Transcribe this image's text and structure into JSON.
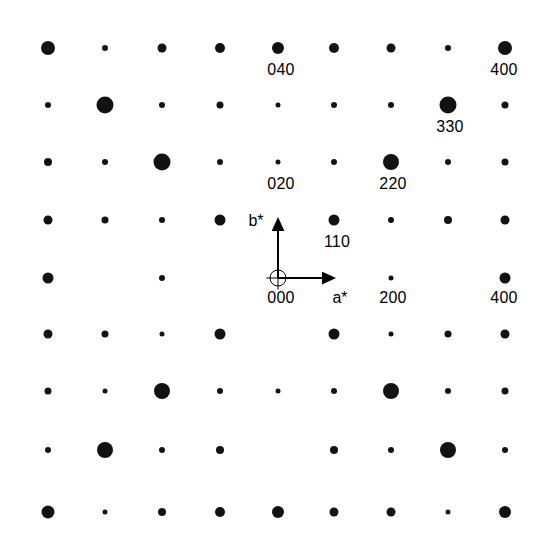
{
  "figure": {
    "kind": "electron-diffraction-pattern",
    "width": 544,
    "height": 550,
    "background_color": "#ffffff",
    "spot_color": "#121212",
    "text_color": "#000000"
  },
  "chart_data": {
    "type": "scatter",
    "title": "",
    "subtitle": "",
    "xlabel": "a*",
    "ylabel": "b*",
    "grid": false,
    "legend": null,
    "axis_ranges": {
      "x": [
        -4,
        4
      ],
      "y": [
        -4,
        4
      ]
    },
    "origin_px": {
      "x": 278,
      "y": 278
    },
    "lattice_spacing_px": 57.0,
    "marker_scale": {
      "description": "marker diameter in px by intensity class",
      "tiny": 5,
      "small": 7,
      "medium": 10,
      "large": 14,
      "xlarge": 17
    },
    "columns_px": [
      48,
      105,
      162,
      220,
      278,
      334,
      391,
      448,
      505
    ],
    "rows_px": [
      48,
      105,
      162,
      220,
      278,
      334,
      391,
      448,
      510
    ],
    "points": [
      {
        "h": -4,
        "k": 4,
        "x": 48,
        "y": 48,
        "d": 14
      },
      {
        "h": -3,
        "k": 4,
        "x": 105,
        "y": 48,
        "d": 6
      },
      {
        "h": -2,
        "k": 4,
        "x": 162,
        "y": 48,
        "d": 9
      },
      {
        "h": -1,
        "k": 4,
        "x": 220,
        "y": 48,
        "d": 10
      },
      {
        "h": 0,
        "k": 4,
        "x": 278,
        "y": 48,
        "d": 12
      },
      {
        "h": 1,
        "k": 4,
        "x": 334,
        "y": 48,
        "d": 10
      },
      {
        "h": 2,
        "k": 4,
        "x": 391,
        "y": 48,
        "d": 9
      },
      {
        "h": 3,
        "k": 4,
        "x": 448,
        "y": 48,
        "d": 6
      },
      {
        "h": 4,
        "k": 4,
        "x": 505,
        "y": 48,
        "d": 14
      },
      {
        "h": -4,
        "k": 3,
        "x": 48,
        "y": 105,
        "d": 6
      },
      {
        "h": -3,
        "k": 3,
        "x": 105,
        "y": 105,
        "d": 17
      },
      {
        "h": -2,
        "k": 3,
        "x": 162,
        "y": 105,
        "d": 6
      },
      {
        "h": -1,
        "k": 3,
        "x": 220,
        "y": 105,
        "d": 7
      },
      {
        "h": 0,
        "k": 3,
        "x": 278,
        "y": 105,
        "d": 5
      },
      {
        "h": 1,
        "k": 3,
        "x": 334,
        "y": 105,
        "d": 6
      },
      {
        "h": 2,
        "k": 3,
        "x": 391,
        "y": 105,
        "d": 6
      },
      {
        "h": 3,
        "k": 3,
        "x": 448,
        "y": 105,
        "d": 17
      },
      {
        "h": 4,
        "k": 3,
        "x": 505,
        "y": 105,
        "d": 7
      },
      {
        "h": -4,
        "k": 2,
        "x": 48,
        "y": 162,
        "d": 8
      },
      {
        "h": -3,
        "k": 2,
        "x": 105,
        "y": 162,
        "d": 6
      },
      {
        "h": -2,
        "k": 2,
        "x": 162,
        "y": 162,
        "d": 17
      },
      {
        "h": -1,
        "k": 2,
        "x": 220,
        "y": 162,
        "d": 6
      },
      {
        "h": 0,
        "k": 2,
        "x": 278,
        "y": 162,
        "d": 5
      },
      {
        "h": 1,
        "k": 2,
        "x": 334,
        "y": 162,
        "d": 6
      },
      {
        "h": 2,
        "k": 2,
        "x": 391,
        "y": 162,
        "d": 16
      },
      {
        "h": 3,
        "k": 2,
        "x": 448,
        "y": 162,
        "d": 6
      },
      {
        "h": 4,
        "k": 2,
        "x": 505,
        "y": 162,
        "d": 7
      },
      {
        "h": -4,
        "k": 1,
        "x": 48,
        "y": 220,
        "d": 9
      },
      {
        "h": -3,
        "k": 1,
        "x": 105,
        "y": 220,
        "d": 7
      },
      {
        "h": -2,
        "k": 1,
        "x": 162,
        "y": 220,
        "d": 6
      },
      {
        "h": -1,
        "k": 1,
        "x": 220,
        "y": 220,
        "d": 11
      },
      {
        "h": 1,
        "k": 1,
        "x": 334,
        "y": 220,
        "d": 11
      },
      {
        "h": 2,
        "k": 1,
        "x": 391,
        "y": 220,
        "d": 6
      },
      {
        "h": 3,
        "k": 1,
        "x": 448,
        "y": 220,
        "d": 8
      },
      {
        "h": 4,
        "k": 1,
        "x": 505,
        "y": 220,
        "d": 9
      },
      {
        "h": -4,
        "k": 0,
        "x": 48,
        "y": 278,
        "d": 11
      },
      {
        "h": -2,
        "k": 0,
        "x": 162,
        "y": 278,
        "d": 6
      },
      {
        "h": 2,
        "k": 0,
        "x": 391,
        "y": 278,
        "d": 5
      },
      {
        "h": 4,
        "k": 0,
        "x": 505,
        "y": 278,
        "d": 11
      },
      {
        "h": -4,
        "k": -1,
        "x": 48,
        "y": 334,
        "d": 9
      },
      {
        "h": -3,
        "k": -1,
        "x": 105,
        "y": 334,
        "d": 7
      },
      {
        "h": -2,
        "k": -1,
        "x": 162,
        "y": 334,
        "d": 5
      },
      {
        "h": -1,
        "k": -1,
        "x": 220,
        "y": 334,
        "d": 11
      },
      {
        "h": 1,
        "k": -1,
        "x": 334,
        "y": 334,
        "d": 11
      },
      {
        "h": 2,
        "k": -1,
        "x": 391,
        "y": 334,
        "d": 5
      },
      {
        "h": 3,
        "k": -1,
        "x": 448,
        "y": 334,
        "d": 7
      },
      {
        "h": 4,
        "k": -1,
        "x": 505,
        "y": 334,
        "d": 9
      },
      {
        "h": -4,
        "k": -2,
        "x": 48,
        "y": 391,
        "d": 7
      },
      {
        "h": -3,
        "k": -2,
        "x": 105,
        "y": 391,
        "d": 5
      },
      {
        "h": -2,
        "k": -2,
        "x": 162,
        "y": 391,
        "d": 16
      },
      {
        "h": -1,
        "k": -2,
        "x": 220,
        "y": 391,
        "d": 6
      },
      {
        "h": 0,
        "k": -2,
        "x": 278,
        "y": 391,
        "d": 5
      },
      {
        "h": 1,
        "k": -2,
        "x": 334,
        "y": 391,
        "d": 6
      },
      {
        "h": 2,
        "k": -2,
        "x": 391,
        "y": 391,
        "d": 16
      },
      {
        "h": 3,
        "k": -2,
        "x": 448,
        "y": 391,
        "d": 6
      },
      {
        "h": 4,
        "k": -2,
        "x": 505,
        "y": 391,
        "d": 7
      },
      {
        "h": -4,
        "k": -3,
        "x": 48,
        "y": 450,
        "d": 6
      },
      {
        "h": -3,
        "k": -3,
        "x": 105,
        "y": 450,
        "d": 16
      },
      {
        "h": -2,
        "k": -3,
        "x": 162,
        "y": 450,
        "d": 6
      },
      {
        "h": -1,
        "k": -3,
        "x": 220,
        "y": 450,
        "d": 8
      },
      {
        "h": 1,
        "k": -3,
        "x": 334,
        "y": 450,
        "d": 8
      },
      {
        "h": 2,
        "k": -3,
        "x": 391,
        "y": 450,
        "d": 6
      },
      {
        "h": 3,
        "k": -3,
        "x": 448,
        "y": 450,
        "d": 16
      },
      {
        "h": 4,
        "k": -3,
        "x": 505,
        "y": 450,
        "d": 6
      },
      {
        "h": -4,
        "k": -4,
        "x": 48,
        "y": 512,
        "d": 13
      },
      {
        "h": -3,
        "k": -4,
        "x": 105,
        "y": 512,
        "d": 5
      },
      {
        "h": -2,
        "k": -4,
        "x": 162,
        "y": 512,
        "d": 8
      },
      {
        "h": -1,
        "k": -4,
        "x": 220,
        "y": 512,
        "d": 10
      },
      {
        "h": 0,
        "k": -4,
        "x": 278,
        "y": 512,
        "d": 12
      },
      {
        "h": 1,
        "k": -4,
        "x": 334,
        "y": 512,
        "d": 9
      },
      {
        "h": 2,
        "k": -4,
        "x": 391,
        "y": 512,
        "d": 9
      },
      {
        "h": 3,
        "k": -4,
        "x": 448,
        "y": 512,
        "d": 5
      },
      {
        "h": 4,
        "k": -4,
        "x": 505,
        "y": 512,
        "d": 12
      }
    ],
    "annotations": [
      {
        "text": "040",
        "x": 281,
        "y": 62,
        "refers_to": "0 4 0"
      },
      {
        "text": "400",
        "x": 504,
        "y": 62,
        "refers_to": "4 0 0 top-right"
      },
      {
        "text": "330",
        "x": 450,
        "y": 119,
        "refers_to": "3 3 0"
      },
      {
        "text": "020",
        "x": 281,
        "y": 176,
        "refers_to": "0 2 0"
      },
      {
        "text": "220",
        "x": 393,
        "y": 176,
        "refers_to": "2 2 0"
      },
      {
        "text": "110",
        "x": 337,
        "y": 234,
        "refers_to": "1 1 0"
      },
      {
        "text": "000",
        "x": 281,
        "y": 290,
        "refers_to": "origin"
      },
      {
        "text": "200",
        "x": 393,
        "y": 290,
        "refers_to": "2 0 0"
      },
      {
        "text": "400",
        "x": 504,
        "y": 290,
        "refers_to": "4 0 0"
      }
    ],
    "axis_vectors": [
      {
        "name": "a*",
        "label": "a*",
        "from": {
          "x": 278,
          "y": 278
        },
        "to": {
          "x": 338,
          "y": 278
        },
        "label_x": 340,
        "label_y": 290
      },
      {
        "name": "b*",
        "label": "b*",
        "from": {
          "x": 278,
          "y": 278
        },
        "to": {
          "x": 278,
          "y": 215
        },
        "label_x": 256,
        "label_y": 213
      }
    ],
    "origin_marker": {
      "type": "crossed-circle",
      "x": 278,
      "y": 278,
      "radius": 8.5
    }
  }
}
